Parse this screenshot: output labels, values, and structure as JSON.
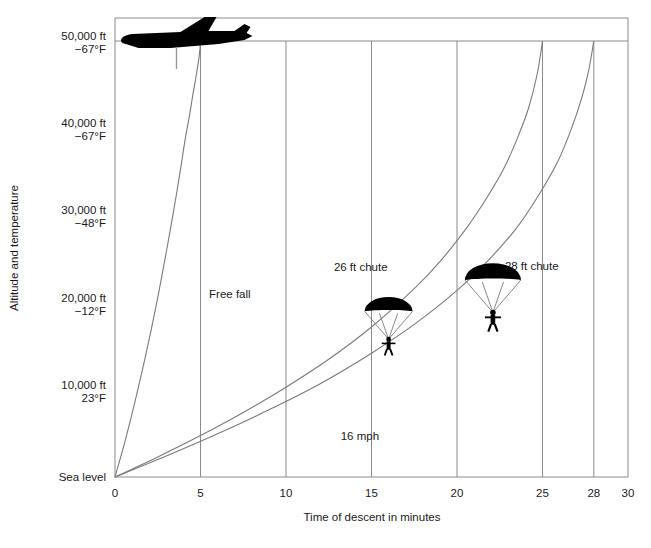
{
  "chart_data": {
    "type": "line",
    "title": "",
    "xlabel": "Time of descent in minutes",
    "ylabel": "Altitude and temperature",
    "xlim": [
      0,
      30
    ],
    "ylim": [
      0,
      50000
    ],
    "grid": true,
    "legend_position": "inline-annotations",
    "x_ticks": [
      {
        "value": 0,
        "label": "0"
      },
      {
        "value": 5,
        "label": "5"
      },
      {
        "value": 10,
        "label": "10"
      },
      {
        "value": 15,
        "label": "15"
      },
      {
        "value": 20,
        "label": "20"
      },
      {
        "value": 25,
        "label": "25"
      },
      {
        "value": 28,
        "label": "28"
      },
      {
        "value": 30,
        "label": "30"
      }
    ],
    "y_ticks": [
      {
        "value": 50000,
        "altitude": "50,000 ft",
        "temperature": "−67°F"
      },
      {
        "value": 40000,
        "altitude": "40,000 ft",
        "temperature": "−67°F"
      },
      {
        "value": 30000,
        "altitude": "30,000 ft",
        "temperature": "−48°F"
      },
      {
        "value": 20000,
        "altitude": "20,000 ft",
        "temperature": "−12°F"
      },
      {
        "value": 10000,
        "altitude": "10,000 ft",
        "temperature": "23°F"
      },
      {
        "value": 0,
        "altitude": "Sea level",
        "temperature": ""
      }
    ],
    "series": [
      {
        "name": "Free fall",
        "label": "Free fall",
        "color": "#7a7a7a",
        "descent_time_minutes": 5,
        "x": [
          0,
          0.6,
          1.2,
          1.8,
          2.4,
          3.0,
          3.4,
          3.8,
          4.1,
          4.35,
          4.55,
          4.7,
          4.82,
          4.9,
          4.96,
          5.0
        ],
        "y": [
          0,
          4200,
          8900,
          14000,
          19600,
          25800,
          30200,
          34900,
          38700,
          41400,
          43800,
          45500,
          46900,
          47900,
          48900,
          50000
        ]
      },
      {
        "name": "26 ft chute",
        "label": "26 ft chute",
        "color": "#7a7a7a",
        "descent_time_minutes": 25,
        "x": [
          0,
          2.5,
          5,
          7.5,
          10,
          12.5,
          15,
          17.5,
          19,
          20.5,
          21.8,
          22.8,
          23.6,
          24.2,
          24.7,
          25
        ],
        "y": [
          0,
          2300,
          4750,
          7400,
          10300,
          13500,
          17200,
          21600,
          24700,
          28400,
          32200,
          35600,
          39200,
          42400,
          46300,
          50000
        ]
      },
      {
        "name": "28 ft chute",
        "label": "28 ft chute",
        "color": "#7a7a7a",
        "descent_time_minutes": 28,
        "x": [
          0,
          3,
          6,
          9,
          12,
          15,
          17.5,
          20,
          22,
          23.5,
          24.8,
          25.9,
          26.7,
          27.3,
          27.7,
          28
        ],
        "y": [
          0,
          2400,
          4950,
          7700,
          10700,
          14200,
          17500,
          21400,
          25200,
          28600,
          32400,
          36200,
          40000,
          43500,
          46600,
          50000
        ]
      }
    ],
    "annotations": [
      {
        "name": "free-fall",
        "text": "Free fall",
        "x_min": 5.5,
        "y_ft": 20500
      },
      {
        "name": "speed",
        "text": "16 mph",
        "x_min": 13.2,
        "y_ft": 4200
      },
      {
        "name": "chute-26",
        "text": "26 ft chute",
        "x_min": 12.8,
        "y_ft": 23600
      },
      {
        "name": "chute-28",
        "text": "28 ft chute",
        "x_min": 22.8,
        "y_ft": 23700
      }
    ],
    "icons": [
      {
        "name": "airplane-icon",
        "x_min": 5.0,
        "y_ft": 50000
      },
      {
        "name": "parachutist-26ft-icon",
        "x_min": 16.0,
        "y_ft": 19000
      },
      {
        "name": "parachutist-28ft-icon",
        "x_min": 22.1,
        "y_ft": 22600
      }
    ]
  },
  "caption": {
    "text": ""
  },
  "colors": {
    "frame": "#8a8a8a",
    "grid": "#8a8a8a",
    "curve": "#7a7a7a",
    "icon": "#000000",
    "text": "#1a1a1a",
    "background": "#ffffff"
  }
}
